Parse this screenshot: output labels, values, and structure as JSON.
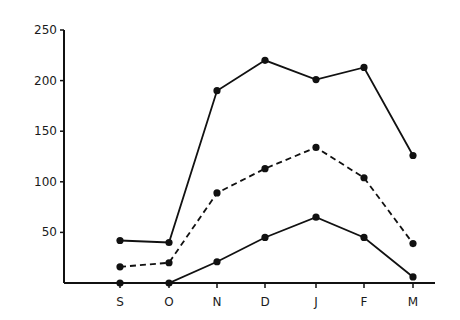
{
  "chart_data": {
    "type": "line",
    "title": "",
    "xlabel": "",
    "ylabel": "",
    "categories": [
      "S",
      "O",
      "N",
      "D",
      "J",
      "F",
      "M"
    ],
    "ylim": [
      0,
      250
    ],
    "yticks": [
      50,
      100,
      150,
      200,
      250
    ],
    "grid": false,
    "legend": null,
    "series": [
      {
        "name": "upper (solid)",
        "style": "solid",
        "values": [
          42,
          40,
          190,
          220,
          201,
          213,
          126
        ]
      },
      {
        "name": "middle (dashed)",
        "style": "dashed",
        "values": [
          16,
          20,
          89,
          113,
          134,
          104,
          39
        ]
      },
      {
        "name": "lower (solid)",
        "style": "solid",
        "values": [
          0,
          0,
          21,
          45,
          65,
          45,
          6
        ]
      }
    ]
  },
  "colors": {
    "line": "#111111",
    "axis": "#111111",
    "background": "#ffffff"
  }
}
